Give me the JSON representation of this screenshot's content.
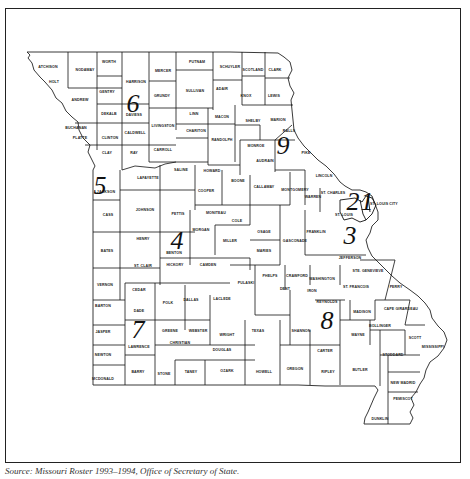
{
  "map": {
    "title": "Missouri Congressional Districts",
    "caption": "Source: Missouri Roster 1993–1994, Office of Secretary of State.",
    "districts": [
      {
        "number": "1",
        "x": 367,
        "y": 210
      },
      {
        "number": "2",
        "x": 353,
        "y": 210
      },
      {
        "number": "3",
        "x": 350,
        "y": 244
      },
      {
        "number": "4",
        "x": 177,
        "y": 249
      },
      {
        "number": "5",
        "x": 100,
        "y": 194
      },
      {
        "number": "6",
        "x": 133,
        "y": 112
      },
      {
        "number": "7",
        "x": 138,
        "y": 338
      },
      {
        "number": "8",
        "x": 327,
        "y": 329
      },
      {
        "number": "9",
        "x": 283,
        "y": 154
      }
    ],
    "counties": [
      {
        "name": "ATCHISON",
        "x": 48,
        "y": 68
      },
      {
        "name": "NODAWAY",
        "x": 85,
        "y": 71
      },
      {
        "name": "HOLT",
        "x": 54,
        "y": 83
      },
      {
        "name": "WORTH",
        "x": 109,
        "y": 63
      },
      {
        "name": "HARRISON",
        "x": 136,
        "y": 83
      },
      {
        "name": "MERCER",
        "x": 163,
        "y": 72
      },
      {
        "name": "PUTNAM",
        "x": 197,
        "y": 63
      },
      {
        "name": "SCHUYLER",
        "x": 230,
        "y": 68
      },
      {
        "name": "SCOTLAND",
        "x": 253,
        "y": 71
      },
      {
        "name": "CLARK",
        "x": 275,
        "y": 71
      },
      {
        "name": "GENTRY",
        "x": 107,
        "y": 93
      },
      {
        "name": "ANDREW",
        "x": 80,
        "y": 101
      },
      {
        "name": "DAVIESS",
        "x": 134,
        "y": 116
      },
      {
        "name": "GRUNDY",
        "x": 162,
        "y": 97
      },
      {
        "name": "SULLIVAN",
        "x": 195,
        "y": 92
      },
      {
        "name": "ADAIR",
        "x": 222,
        "y": 90
      },
      {
        "name": "KNOX",
        "x": 246,
        "y": 97
      },
      {
        "name": "LEWIS",
        "x": 274,
        "y": 97
      },
      {
        "name": "DEKALB",
        "x": 109,
        "y": 115
      },
      {
        "name": "BUCHANAN",
        "x": 76,
        "y": 129
      },
      {
        "name": "LIVINGSTON",
        "x": 163,
        "y": 127
      },
      {
        "name": "LINN",
        "x": 194,
        "y": 115
      },
      {
        "name": "MACON",
        "x": 222,
        "y": 118
      },
      {
        "name": "SHELBY",
        "x": 253,
        "y": 122
      },
      {
        "name": "MARION",
        "x": 278,
        "y": 121
      },
      {
        "name": "PLATTE",
        "x": 80,
        "y": 139
      },
      {
        "name": "CLINTON",
        "x": 110,
        "y": 139
      },
      {
        "name": "CALDWELL",
        "x": 135,
        "y": 134
      },
      {
        "name": "CHARITON",
        "x": 196,
        "y": 132
      },
      {
        "name": "RANDOLPH",
        "x": 222,
        "y": 141
      },
      {
        "name": "MONROE",
        "x": 256,
        "y": 147
      },
      {
        "name": "RALLS",
        "x": 289,
        "y": 132
      },
      {
        "name": "CLAY",
        "x": 107,
        "y": 154
      },
      {
        "name": "RAY",
        "x": 134,
        "y": 154
      },
      {
        "name": "CARROLL",
        "x": 163,
        "y": 151
      },
      {
        "name": "PIKE",
        "x": 306,
        "y": 154
      },
      {
        "name": "JACKSON",
        "x": 106,
        "y": 193
      },
      {
        "name": "LAFAYETTE",
        "x": 148,
        "y": 179
      },
      {
        "name": "SALINE",
        "x": 181,
        "y": 171
      },
      {
        "name": "HOWARD",
        "x": 212,
        "y": 172
      },
      {
        "name": "BOONE",
        "x": 238,
        "y": 182
      },
      {
        "name": "AUDRAIN",
        "x": 265,
        "y": 162
      },
      {
        "name": "LINCOLN",
        "x": 324,
        "y": 177
      },
      {
        "name": "COOPER",
        "x": 206,
        "y": 192
      },
      {
        "name": "CALLAWAY",
        "x": 264,
        "y": 188
      },
      {
        "name": "MONTGOMERY",
        "x": 295,
        "y": 191
      },
      {
        "name": "WARREN",
        "x": 313,
        "y": 198
      },
      {
        "name": "ST. CHARLES",
        "x": 333,
        "y": 194
      },
      {
        "name": "ST. LOUIS",
        "x": 344,
        "y": 216
      },
      {
        "name": "ST. LOUIS CITY",
        "x": 384,
        "y": 205
      },
      {
        "name": "CASS",
        "x": 108,
        "y": 216
      },
      {
        "name": "JOHNSON",
        "x": 145,
        "y": 211
      },
      {
        "name": "PETTIS",
        "x": 178,
        "y": 215
      },
      {
        "name": "MONITEAU",
        "x": 216,
        "y": 214
      },
      {
        "name": "COLE",
        "x": 237,
        "y": 222
      },
      {
        "name": "OSAGE",
        "x": 264,
        "y": 233
      },
      {
        "name": "GASCONADE",
        "x": 295,
        "y": 242
      },
      {
        "name": "FRANKLIN",
        "x": 316,
        "y": 233
      },
      {
        "name": "JEFFERSON",
        "x": 350,
        "y": 259
      },
      {
        "name": "MORGAN",
        "x": 201,
        "y": 231
      },
      {
        "name": "MILLER",
        "x": 230,
        "y": 242
      },
      {
        "name": "MARIES",
        "x": 264,
        "y": 252
      },
      {
        "name": "BATES",
        "x": 107,
        "y": 252
      },
      {
        "name": "HENRY",
        "x": 143,
        "y": 240
      },
      {
        "name": "BENTON",
        "x": 174,
        "y": 254
      },
      {
        "name": "ST. CLAIR",
        "x": 143,
        "y": 267
      },
      {
        "name": "HICKORY",
        "x": 175,
        "y": 266
      },
      {
        "name": "CAMDEN",
        "x": 208,
        "y": 266
      },
      {
        "name": "PHELPS",
        "x": 270,
        "y": 277
      },
      {
        "name": "CRAWFORD",
        "x": 297,
        "y": 277
      },
      {
        "name": "WASHINGTON",
        "x": 322,
        "y": 280
      },
      {
        "name": "ST. FRANCOIS",
        "x": 356,
        "y": 288
      },
      {
        "name": "STE. GENEVIEVE",
        "x": 368,
        "y": 272
      },
      {
        "name": "PERRY",
        "x": 396,
        "y": 288
      },
      {
        "name": "VERNON",
        "x": 105,
        "y": 286
      },
      {
        "name": "CEDAR",
        "x": 139,
        "y": 291
      },
      {
        "name": "POLK",
        "x": 168,
        "y": 304
      },
      {
        "name": "DALLAS",
        "x": 191,
        "y": 301
      },
      {
        "name": "LACLEDE",
        "x": 222,
        "y": 300
      },
      {
        "name": "PULASKI",
        "x": 246,
        "y": 284
      },
      {
        "name": "DENT",
        "x": 285,
        "y": 290
      },
      {
        "name": "IRON",
        "x": 312,
        "y": 292
      },
      {
        "name": "REYNOLDS",
        "x": 327,
        "y": 303
      },
      {
        "name": "MADISON",
        "x": 362,
        "y": 313
      },
      {
        "name": "CAPE GIRARDEAU",
        "x": 401,
        "y": 310
      },
      {
        "name": "BOLLINGER",
        "x": 380,
        "y": 327
      },
      {
        "name": "BARTON",
        "x": 103,
        "y": 307
      },
      {
        "name": "DADE",
        "x": 139,
        "y": 312
      },
      {
        "name": "GREENE",
        "x": 170,
        "y": 332
      },
      {
        "name": "WEBSTER",
        "x": 198,
        "y": 332
      },
      {
        "name": "WRIGHT",
        "x": 227,
        "y": 336
      },
      {
        "name": "TEXAS",
        "x": 258,
        "y": 332
      },
      {
        "name": "SHANNON",
        "x": 301,
        "y": 332
      },
      {
        "name": "WAYNE",
        "x": 358,
        "y": 336
      },
      {
        "name": "SCOTT",
        "x": 415,
        "y": 339
      },
      {
        "name": "MISSISSIPPI",
        "x": 433,
        "y": 348
      },
      {
        "name": "JASPER",
        "x": 103,
        "y": 333
      },
      {
        "name": "LAWRENCE",
        "x": 139,
        "y": 348
      },
      {
        "name": "CHRISTIAN",
        "x": 180,
        "y": 344
      },
      {
        "name": "DOUGLAS",
        "x": 222,
        "y": 351
      },
      {
        "name": "CARTER",
        "x": 325,
        "y": 352
      },
      {
        "name": "STODDARD",
        "x": 393,
        "y": 356
      },
      {
        "name": "NEWTON",
        "x": 103,
        "y": 356
      },
      {
        "name": "BARRY",
        "x": 138,
        "y": 373
      },
      {
        "name": "STONE",
        "x": 164,
        "y": 375
      },
      {
        "name": "TANEY",
        "x": 191,
        "y": 373
      },
      {
        "name": "OZARK",
        "x": 227,
        "y": 372
      },
      {
        "name": "HOWELL",
        "x": 264,
        "y": 373
      },
      {
        "name": "OREGON",
        "x": 295,
        "y": 370
      },
      {
        "name": "RIPLEY",
        "x": 328,
        "y": 373
      },
      {
        "name": "BUTLER",
        "x": 360,
        "y": 371
      },
      {
        "name": "NEW MADRID",
        "x": 403,
        "y": 384
      },
      {
        "name": "MCDONALD",
        "x": 103,
        "y": 380
      },
      {
        "name": "PEMISCOT",
        "x": 403,
        "y": 400
      },
      {
        "name": "DUNKLIN",
        "x": 380,
        "y": 420
      }
    ]
  }
}
